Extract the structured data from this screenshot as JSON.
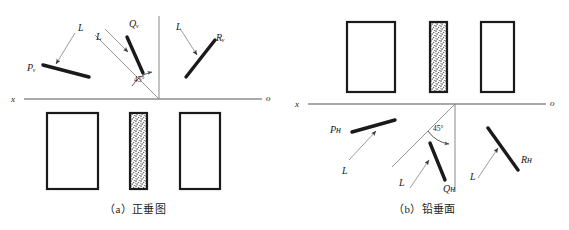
{
  "figure": {
    "panels": [
      {
        "id": "panel-a",
        "caption": "（a）正垂图",
        "axis": {
          "left_label": "x",
          "right_label": "o"
        },
        "angle_label": "45°",
        "traces": [
          {
            "name": "P",
            "label": "Pᵥ",
            "leader_label": "L"
          },
          {
            "name": "Q",
            "label": "Qᵥ",
            "leader_label": "L"
          },
          {
            "name": "R",
            "label": "Rᵥ",
            "leader_label": "L"
          }
        ],
        "shapes": [
          {
            "name": "plate-left",
            "fill": "white"
          },
          {
            "name": "plate-middle",
            "fill": "stippled"
          },
          {
            "name": "plate-right",
            "fill": "white"
          }
        ]
      },
      {
        "id": "panel-b",
        "caption": "（b）铅垂面",
        "axis": {
          "left_label": "x",
          "right_label": "o"
        },
        "angle_label": "45°",
        "traces": [
          {
            "name": "P",
            "label": "Pн",
            "leader_label": "L"
          },
          {
            "name": "Q",
            "label": "Qн",
            "leader_label": "L"
          },
          {
            "name": "R",
            "label": "Rн",
            "leader_label": "L"
          }
        ],
        "shapes": [
          {
            "name": "plate-left",
            "fill": "white"
          },
          {
            "name": "plate-middle",
            "fill": "stippled"
          },
          {
            "name": "plate-right",
            "fill": "white"
          }
        ]
      }
    ],
    "colors": {
      "ink": "#1a1a1a",
      "thin_line": "#6e6e6e",
      "axis": "#555555",
      "stipple": "#5a5a5a",
      "background": "#ffffff"
    }
  }
}
